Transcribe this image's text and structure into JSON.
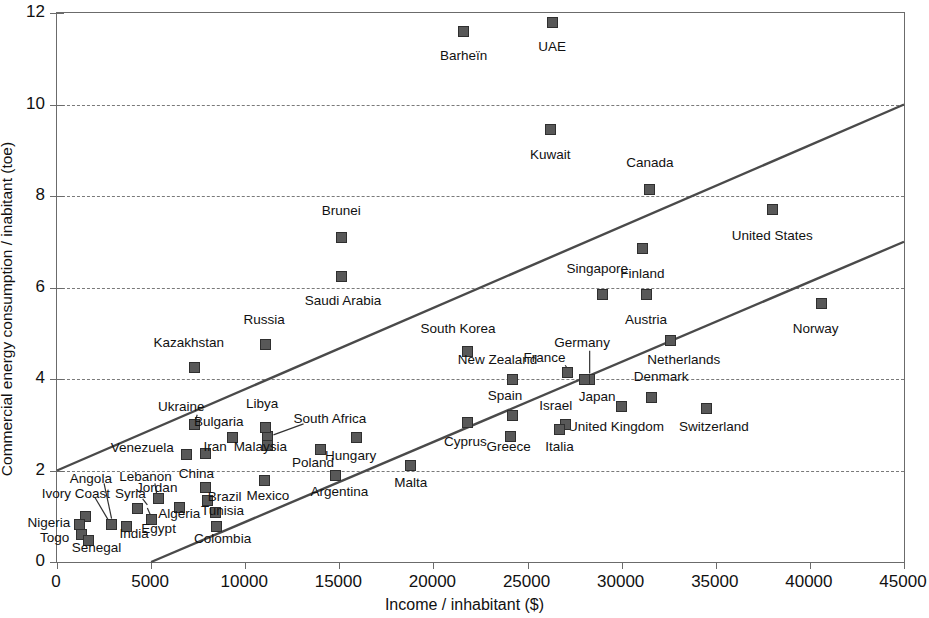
{
  "chart_data": {
    "type": "scatter",
    "title": "",
    "xlabel": "Income / inhabitant ($)",
    "ylabel": "Commercial energy consumption / inabitant (toe)",
    "xlim": [
      0,
      45000
    ],
    "ylim": [
      0,
      12
    ],
    "xticks": [
      0,
      5000,
      10000,
      15000,
      20000,
      25000,
      30000,
      35000,
      40000,
      45000
    ],
    "yticks": [
      0,
      2,
      4,
      6,
      8,
      10,
      12
    ],
    "xtick_labels": [
      "0",
      "5000",
      "10000",
      "15000",
      "20000",
      "25000",
      "30000",
      "35000",
      "40000",
      "45000"
    ],
    "ytick_labels": [
      "0",
      "2",
      "4",
      "6",
      "8",
      "10",
      "12"
    ],
    "grid": "horizontal-dashed",
    "grid_color": "#7a7a7a",
    "legend": "none",
    "marker_color": "#585858",
    "marker_edge_color": "#2f2f2f",
    "marker_shape": "square",
    "axis_color": "#6b6b6b",
    "trendline_color": "#4a4a4a",
    "trendlines": [
      {
        "name": "upper-bound-line",
        "x1": 0,
        "y1": 2.0,
        "x2": 45000,
        "y2": 10.0
      },
      {
        "name": "lower-bound-line",
        "x1": 5000,
        "y1": 0.0,
        "x2": 45000,
        "y2": 7.0
      }
    ],
    "points": [
      {
        "label": "Barheïn",
        "x": 21600,
        "y": 11.6,
        "lx": 21600,
        "ly": 11.05,
        "align": "c"
      },
      {
        "label": "UAE",
        "x": 26300,
        "y": 11.8,
        "lx": 26300,
        "ly": 11.25,
        "align": "c"
      },
      {
        "label": "Kuwait",
        "x": 26200,
        "y": 9.45,
        "lx": 26200,
        "ly": 8.9,
        "align": "c"
      },
      {
        "label": "Canada",
        "x": 31500,
        "y": 8.15,
        "lx": 31500,
        "ly": 8.72,
        "align": "c"
      },
      {
        "label": "United States",
        "x": 38000,
        "y": 7.7,
        "lx": 38000,
        "ly": 7.12,
        "align": "c"
      },
      {
        "label": "Brunei",
        "x": 15100,
        "y": 7.1,
        "lx": 15100,
        "ly": 7.68,
        "align": "c"
      },
      {
        "label": "Finland",
        "x": 31100,
        "y": 6.85,
        "lx": 31100,
        "ly": 6.3,
        "align": "c"
      },
      {
        "label": "Saudi Arabia",
        "x": 15100,
        "y": 6.25,
        "lx": 15200,
        "ly": 5.7,
        "align": "c"
      },
      {
        "label": "Singapore",
        "x": 29000,
        "y": 5.85,
        "lx": 28700,
        "ly": 6.4,
        "align": "c"
      },
      {
        "label": "Austria",
        "x": 31300,
        "y": 5.85,
        "lx": 31300,
        "ly": 5.3,
        "align": "c"
      },
      {
        "label": "Norway",
        "x": 40600,
        "y": 5.65,
        "lx": 40300,
        "ly": 5.1,
        "align": "c"
      },
      {
        "label": "Netherlands",
        "x": 32600,
        "y": 4.85,
        "lx": 33300,
        "ly": 4.42,
        "align": "c"
      },
      {
        "label": "Russia",
        "x": 11100,
        "y": 4.75,
        "lx": 11000,
        "ly": 5.3,
        "align": "c"
      },
      {
        "label": "South Korea",
        "x": 21800,
        "y": 4.6,
        "lx": 21300,
        "ly": 5.1,
        "align": "c"
      },
      {
        "label": "Kazakhstan",
        "x": 7300,
        "y": 4.25,
        "lx": 7000,
        "ly": 4.78,
        "align": "c"
      },
      {
        "label": "France",
        "x": 27100,
        "y": 4.15,
        "lx": 25900,
        "ly": 4.45,
        "align": "c"
      },
      {
        "label": "Germany",
        "x": 28300,
        "y": 4.0,
        "lx": 27900,
        "ly": 4.78,
        "align": "c"
      },
      {
        "label": "New Zealand",
        "x": 24200,
        "y": 4.0,
        "lx": 23400,
        "ly": 4.42,
        "align": "c"
      },
      {
        "label": "Japan",
        "x": 28000,
        "y": 4.0,
        "lx": 28700,
        "ly": 3.6,
        "align": "c"
      },
      {
        "label": "Denmark",
        "x": 31600,
        "y": 3.6,
        "lx": 32100,
        "ly": 4.05,
        "align": "c"
      },
      {
        "label": "Switzerland",
        "x": 34500,
        "y": 3.35,
        "lx": 34900,
        "ly": 2.95,
        "align": "c"
      },
      {
        "label": "United Kingdom",
        "x": 30000,
        "y": 3.4,
        "lx": 29700,
        "ly": 2.95,
        "align": "c"
      },
      {
        "label": "Spain",
        "x": 24200,
        "y": 3.2,
        "lx": 23800,
        "ly": 3.62,
        "align": "c"
      },
      {
        "label": "Israel",
        "x": 27000,
        "y": 3.0,
        "lx": 26500,
        "ly": 3.42,
        "align": "c"
      },
      {
        "label": "Italia",
        "x": 26700,
        "y": 2.9,
        "lx": 26700,
        "ly": 2.52,
        "align": "c"
      },
      {
        "label": "Greece",
        "x": 24100,
        "y": 2.75,
        "lx": 24000,
        "ly": 2.52,
        "align": "c"
      },
      {
        "label": "Cyprus",
        "x": 21800,
        "y": 3.05,
        "lx": 21700,
        "ly": 2.62,
        "align": "c"
      },
      {
        "label": "South Africa",
        "x": 11200,
        "y": 2.75,
        "lx": 14500,
        "ly": 3.13,
        "align": "c"
      },
      {
        "label": "Libya",
        "x": 11100,
        "y": 2.95,
        "lx": 10900,
        "ly": 3.45,
        "align": "c"
      },
      {
        "label": "Ukraine",
        "x": 7300,
        "y": 3.0,
        "lx": 6600,
        "ly": 3.38,
        "align": "c"
      },
      {
        "label": "Bulgaria",
        "x": 9300,
        "y": 2.72,
        "lx": 8600,
        "ly": 3.05,
        "align": "c"
      },
      {
        "label": "Hungary",
        "x": 15900,
        "y": 2.72,
        "lx": 15600,
        "ly": 2.32,
        "align": "c"
      },
      {
        "label": "Iran",
        "x": 7900,
        "y": 2.38,
        "lx": 8400,
        "ly": 2.52,
        "align": "c"
      },
      {
        "label": "Venezuela",
        "x": 6900,
        "y": 2.35,
        "lx": 6200,
        "ly": 2.5,
        "align": "r"
      },
      {
        "label": "Malaysia",
        "x": 11200,
        "y": 2.55,
        "lx": 10800,
        "ly": 2.52,
        "align": "c"
      },
      {
        "label": "Poland",
        "x": 14000,
        "y": 2.45,
        "lx": 13600,
        "ly": 2.17,
        "align": "c"
      },
      {
        "label": "Malta",
        "x": 18800,
        "y": 2.1,
        "lx": 18800,
        "ly": 1.72,
        "align": "c"
      },
      {
        "label": "Argentina",
        "x": 14800,
        "y": 1.9,
        "lx": 15000,
        "ly": 1.52,
        "align": "c"
      },
      {
        "label": "Mexico",
        "x": 11000,
        "y": 1.78,
        "lx": 11200,
        "ly": 1.45,
        "align": "c"
      },
      {
        "label": "China",
        "x": 7900,
        "y": 1.62,
        "lx": 7400,
        "ly": 1.92,
        "align": "c"
      },
      {
        "label": "Brazil",
        "x": 8000,
        "y": 1.35,
        "lx": 8900,
        "ly": 1.42,
        "align": "c"
      },
      {
        "label": "Lebanon",
        "x": 5400,
        "y": 1.38,
        "lx": 4700,
        "ly": 1.85,
        "align": "c"
      },
      {
        "label": "Jordan",
        "x": 5400,
        "y": 1.38,
        "lx": 5300,
        "ly": 1.62,
        "align": "c"
      },
      {
        "label": "Syria",
        "x": 4300,
        "y": 1.18,
        "lx": 3900,
        "ly": 1.48,
        "align": "c"
      },
      {
        "label": "Algeria",
        "x": 6500,
        "y": 1.2,
        "lx": 6500,
        "ly": 1.05,
        "align": "c"
      },
      {
        "label": "Tunisia",
        "x": 8400,
        "y": 1.08,
        "lx": 8800,
        "ly": 1.12,
        "align": "c"
      },
      {
        "label": "Colombia",
        "x": 8500,
        "y": 0.78,
        "lx": 8800,
        "ly": 0.5,
        "align": "c"
      },
      {
        "label": "Egypt",
        "x": 5000,
        "y": 0.92,
        "lx": 5400,
        "ly": 0.72,
        "align": "c"
      },
      {
        "label": "India",
        "x": 3700,
        "y": 0.78,
        "lx": 4100,
        "ly": 0.62,
        "align": "c"
      },
      {
        "label": "Angola",
        "x": 2900,
        "y": 0.82,
        "lx": 1800,
        "ly": 1.82,
        "align": "c"
      },
      {
        "label": "Ivory Coast",
        "x": 1500,
        "y": 1.0,
        "lx": 1000,
        "ly": 1.48,
        "align": "c"
      },
      {
        "label": "Nigeria",
        "x": 1200,
        "y": 0.82,
        "lx": 700,
        "ly": 0.85,
        "align": "r"
      },
      {
        "label": "Togo",
        "x": 1300,
        "y": 0.6,
        "lx": 650,
        "ly": 0.52,
        "align": "r"
      },
      {
        "label": "Senegal",
        "x": 1700,
        "y": 0.48,
        "lx": 2100,
        "ly": 0.3,
        "align": "c"
      }
    ],
    "leaders": [
      {
        "name": "angola-leader",
        "x1": 2500,
        "y1": 1.72,
        "x2": 2900,
        "y2": 0.95
      },
      {
        "name": "ivory-coast-leader",
        "x1": 2000,
        "y1": 1.42,
        "x2": 2750,
        "y2": 0.9
      },
      {
        "name": "lebanon-leader",
        "x1": 5200,
        "y1": 1.72,
        "x2": 5300,
        "y2": 1.48
      },
      {
        "name": "syria-leader",
        "x1": 4550,
        "y1": 1.38,
        "x2": 4800,
        "y2": 1.25
      },
      {
        "name": "egypt-leader",
        "x1": 5150,
        "y1": 0.85,
        "x2": 4800,
        "y2": 1.18
      },
      {
        "name": "south-africa-leader",
        "x1": 13100,
        "y1": 3.02,
        "x2": 11500,
        "y2": 2.78
      },
      {
        "name": "germany-leader",
        "x1": 28300,
        "y1": 4.62,
        "x2": 28300,
        "y2": 4.12
      },
      {
        "name": "france-leader",
        "x1": 27000,
        "y1": 4.3,
        "x2": 27400,
        "y2": 4.05
      },
      {
        "name": "ukraine-leader",
        "x1": 7450,
        "y1": 3.22,
        "x2": 7350,
        "y2": 3.1
      }
    ]
  }
}
